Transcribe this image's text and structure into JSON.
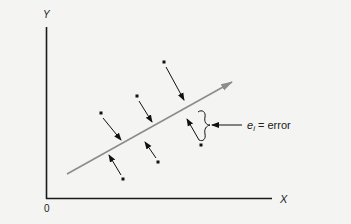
{
  "diagram": {
    "axes": {
      "y_label": "Y",
      "x_label": "X",
      "origin_label": "0"
    },
    "annotation": {
      "symbol": "e",
      "subscript": "i",
      "text": " = error"
    },
    "colors": {
      "background": "#f4f4f3",
      "axis": "#1a1a1a",
      "regression_line": "#8c8c8c",
      "points": "#111111",
      "arrows": "#111111"
    },
    "points": [
      {
        "x": 101,
        "y": 113,
        "arrow_to": [
          121,
          140
        ]
      },
      {
        "x": 137,
        "y": 96,
        "arrow_to": [
          152,
          122
        ]
      },
      {
        "x": 164,
        "y": 62,
        "arrow_to": [
          184,
          100
        ]
      },
      {
        "x": 123,
        "y": 179,
        "arrow_to": [
          109,
          155
        ]
      },
      {
        "x": 158,
        "y": 162,
        "arrow_to": [
          145,
          142
        ]
      },
      {
        "x": 201,
        "y": 145,
        "arrow_to": [
          187,
          119
        ]
      }
    ]
  }
}
